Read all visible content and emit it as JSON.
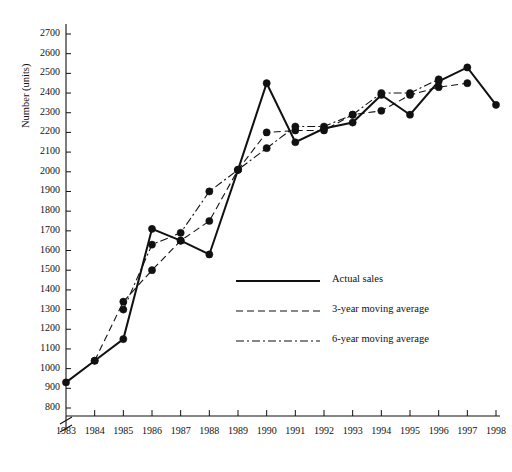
{
  "chart_data": {
    "type": "line",
    "title": "",
    "xlabel": "",
    "ylabel": "Number (units)",
    "x": [
      1983,
      1984,
      1985,
      1986,
      1987,
      1988,
      1989,
      1990,
      1991,
      1992,
      1993,
      1994,
      1995,
      1996,
      1997,
      1998
    ],
    "xlim": [
      1983,
      1998
    ],
    "ylim": [
      800,
      2700
    ],
    "yticks": [
      800,
      900,
      1000,
      1100,
      1200,
      1300,
      1400,
      1500,
      1600,
      1700,
      1800,
      1900,
      2000,
      2100,
      2200,
      2300,
      2400,
      2500,
      2600,
      2700
    ],
    "xticks": [
      1983,
      1984,
      1985,
      1986,
      1987,
      1988,
      1989,
      1990,
      1991,
      1992,
      1993,
      1994,
      1995,
      1996,
      1997,
      1998
    ],
    "axis_break": true,
    "grid": false,
    "legend_position": "center",
    "series": [
      {
        "name": "Actual sales",
        "style": "solid",
        "marker": "filled-circle",
        "x": [
          1983,
          1984,
          1985,
          1986,
          1987,
          1988,
          1989,
          1990,
          1991,
          1992,
          1993,
          1994,
          1995,
          1996,
          1997,
          1998
        ],
        "values": [
          930,
          1040,
          1150,
          1710,
          1650,
          1580,
          2010,
          2450,
          2150,
          2220,
          2250,
          2390,
          2290,
          2460,
          2530,
          2340
        ]
      },
      {
        "name": "3-year moving average",
        "style": "dashed",
        "marker": "filled-circle",
        "x": [
          1984,
          1985,
          1986,
          1987,
          1988,
          1989,
          1990,
          1991,
          1992,
          1993,
          1994,
          1995,
          1996,
          1997
        ],
        "values": [
          1040,
          1340,
          1500,
          1650,
          1750,
          2010,
          2200,
          2210,
          2210,
          2290,
          2310,
          2390,
          2430,
          2450
        ]
      },
      {
        "name": "6-year moving average",
        "style": "dash-dot",
        "marker": "filled-circle",
        "x": [
          1985,
          1986,
          1987,
          1988,
          1989,
          1990,
          1991,
          1992,
          1993,
          1994,
          1995,
          1996
        ],
        "values": [
          1300,
          1630,
          1690,
          1900,
          2010,
          2120,
          2230,
          2230,
          2290,
          2400,
          2400,
          2470
        ]
      }
    ],
    "legend": [
      {
        "label": "Actual sales",
        "style": "solid"
      },
      {
        "label": "3-year moving average",
        "style": "dashed"
      },
      {
        "label": "6-year moving average",
        "style": "dash-dot"
      }
    ]
  },
  "axis": {
    "y_title": "Number (units)"
  },
  "colors": {
    "line": "#111111",
    "background": "#ffffff",
    "text": "#111111"
  }
}
